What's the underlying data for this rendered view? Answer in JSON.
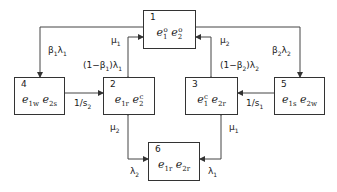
{
  "diagram": {
    "type": "state-transition",
    "states": [
      {
        "id": "1",
        "num": "1",
        "terms": [
          {
            "base": "e",
            "sub": "1",
            "sup": "o"
          },
          {
            "base": "e",
            "sub": "2",
            "sup": "o"
          }
        ]
      },
      {
        "id": "2",
        "num": "2",
        "terms": [
          {
            "base": "e",
            "sub": "1r",
            "sup": ""
          },
          {
            "base": "e",
            "sub": "2",
            "sup": "c"
          }
        ]
      },
      {
        "id": "3",
        "num": "3",
        "terms": [
          {
            "base": "e",
            "sub": "1",
            "sup": "c"
          },
          {
            "base": "e",
            "sub": "2r",
            "sup": ""
          }
        ]
      },
      {
        "id": "4",
        "num": "4",
        "terms": [
          {
            "base": "e",
            "sub": "1w",
            "sup": ""
          },
          {
            "base": "e",
            "sub": "2s",
            "sup": ""
          }
        ]
      },
      {
        "id": "5",
        "num": "5",
        "terms": [
          {
            "base": "e",
            "sub": "1s",
            "sup": ""
          },
          {
            "base": "e",
            "sub": "2w",
            "sup": ""
          }
        ]
      },
      {
        "id": "6",
        "num": "6",
        "terms": [
          {
            "base": "e",
            "sub": "1r",
            "sup": ""
          },
          {
            "base": "e",
            "sub": "2r",
            "sup": ""
          }
        ]
      }
    ],
    "transitions": [
      {
        "from": "1",
        "to": "4",
        "label": "β1λ1"
      },
      {
        "from": "1",
        "to": "2",
        "label": "(1−β1)λ1"
      },
      {
        "from": "2",
        "to": "1",
        "label": "μ1"
      },
      {
        "from": "1",
        "to": "5",
        "label": "β2λ2"
      },
      {
        "from": "1",
        "to": "3",
        "label": "(1−β2)λ2"
      },
      {
        "from": "3",
        "to": "1",
        "label": "μ2"
      },
      {
        "from": "4",
        "to": "2",
        "label": "1/s2"
      },
      {
        "from": "5",
        "to": "3",
        "label": "1/s1"
      },
      {
        "from": "2",
        "to": "6",
        "label": "λ2"
      },
      {
        "from": "6",
        "to": "2",
        "label": "μ2"
      },
      {
        "from": "3",
        "to": "6",
        "label": "λ1"
      },
      {
        "from": "6",
        "to": "3",
        "label": "μ1"
      }
    ]
  },
  "labels": {
    "b1l1": {
      "a": "β",
      "as": "1",
      "b": "λ",
      "bs": "1"
    },
    "one_minus_b1_l1": {
      "pre": "(1−β",
      "ps": "1",
      "post": ")λ",
      "qs": "1"
    },
    "mu1_top": {
      "a": "μ",
      "as": "1"
    },
    "mu2_top": {
      "a": "μ",
      "as": "2"
    },
    "b2l2": {
      "a": "β",
      "as": "2",
      "b": "λ",
      "bs": "2"
    },
    "one_minus_b2_l2": {
      "pre": "(1−β",
      "ps": "2",
      "post": ")λ",
      "qs": "2"
    },
    "inv_s2": {
      "a": "1/s",
      "as": "2"
    },
    "inv_s1": {
      "a": "1/s",
      "as": "1"
    },
    "mu2_bottom": {
      "a": "μ",
      "as": "2"
    },
    "mu1_bottom": {
      "a": "μ",
      "as": "1"
    },
    "lambda2_bottom": {
      "a": "λ",
      "as": "2"
    },
    "lambda1_bottom": {
      "a": "λ",
      "as": "1"
    }
  }
}
